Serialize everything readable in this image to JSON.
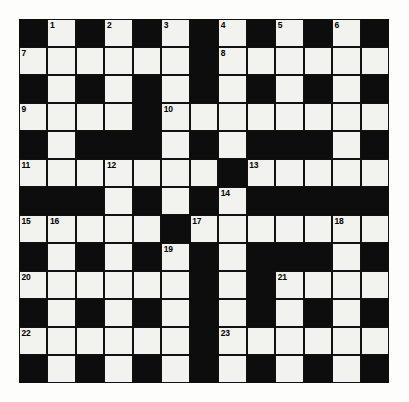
{
  "puzzle": {
    "kind": "crossword-grid",
    "rows": 13,
    "columns": 13,
    "colors": {
      "block": "#0d0d0d",
      "cell": "#f2f2ef",
      "grid_line": "#111111",
      "page_background": "#fdfdfb",
      "number_text": "#000000"
    },
    "numbers_shown": [
      1,
      2,
      3,
      4,
      5,
      6,
      7,
      8,
      9,
      10,
      11,
      12,
      13,
      14,
      15,
      16,
      17,
      18,
      19,
      20,
      21,
      22,
      23
    ],
    "highest_number": 23,
    "blank_cells_filled": 0,
    "cells": [
      [
        {
          "type": "block"
        },
        {
          "type": "light",
          "number": "1"
        },
        {
          "type": "block"
        },
        {
          "type": "light",
          "number": "2"
        },
        {
          "type": "block"
        },
        {
          "type": "light",
          "number": "3"
        },
        {
          "type": "block"
        },
        {
          "type": "light",
          "number": "4"
        },
        {
          "type": "block"
        },
        {
          "type": "light",
          "number": "5"
        },
        {
          "type": "block"
        },
        {
          "type": "light",
          "number": "6"
        },
        {
          "type": "block"
        }
      ],
      [
        {
          "type": "light",
          "number": "7"
        },
        {
          "type": "light"
        },
        {
          "type": "light"
        },
        {
          "type": "light"
        },
        {
          "type": "light"
        },
        {
          "type": "light"
        },
        {
          "type": "block"
        },
        {
          "type": "light",
          "number": "8"
        },
        {
          "type": "light"
        },
        {
          "type": "light"
        },
        {
          "type": "light"
        },
        {
          "type": "light"
        },
        {
          "type": "light"
        }
      ],
      [
        {
          "type": "block"
        },
        {
          "type": "light"
        },
        {
          "type": "block"
        },
        {
          "type": "light"
        },
        {
          "type": "block"
        },
        {
          "type": "light"
        },
        {
          "type": "block"
        },
        {
          "type": "light"
        },
        {
          "type": "block"
        },
        {
          "type": "light"
        },
        {
          "type": "block"
        },
        {
          "type": "light"
        },
        {
          "type": "block"
        }
      ],
      [
        {
          "type": "light",
          "number": "9"
        },
        {
          "type": "light"
        },
        {
          "type": "light"
        },
        {
          "type": "light"
        },
        {
          "type": "block"
        },
        {
          "type": "light",
          "number": "10"
        },
        {
          "type": "light"
        },
        {
          "type": "light"
        },
        {
          "type": "light"
        },
        {
          "type": "light"
        },
        {
          "type": "light"
        },
        {
          "type": "light"
        },
        {
          "type": "light"
        }
      ],
      [
        {
          "type": "block"
        },
        {
          "type": "light"
        },
        {
          "type": "block"
        },
        {
          "type": "block"
        },
        {
          "type": "block"
        },
        {
          "type": "light"
        },
        {
          "type": "block"
        },
        {
          "type": "light"
        },
        {
          "type": "block"
        },
        {
          "type": "block"
        },
        {
          "type": "block"
        },
        {
          "type": "light"
        },
        {
          "type": "block"
        }
      ],
      [
        {
          "type": "light",
          "number": "11"
        },
        {
          "type": "light"
        },
        {
          "type": "light"
        },
        {
          "type": "light",
          "number": "12"
        },
        {
          "type": "light"
        },
        {
          "type": "light"
        },
        {
          "type": "light"
        },
        {
          "type": "block"
        },
        {
          "type": "light",
          "number": "13"
        },
        {
          "type": "light"
        },
        {
          "type": "light"
        },
        {
          "type": "light"
        },
        {
          "type": "light"
        }
      ],
      [
        {
          "type": "block"
        },
        {
          "type": "block"
        },
        {
          "type": "block"
        },
        {
          "type": "light"
        },
        {
          "type": "block"
        },
        {
          "type": "light"
        },
        {
          "type": "block"
        },
        {
          "type": "light",
          "number": "14"
        },
        {
          "type": "block"
        },
        {
          "type": "block"
        },
        {
          "type": "block"
        },
        {
          "type": "block"
        },
        {
          "type": "block"
        }
      ],
      [
        {
          "type": "light",
          "number": "15"
        },
        {
          "type": "light",
          "number": "16"
        },
        {
          "type": "light"
        },
        {
          "type": "light"
        },
        {
          "type": "light"
        },
        {
          "type": "block"
        },
        {
          "type": "light",
          "number": "17"
        },
        {
          "type": "light"
        },
        {
          "type": "light"
        },
        {
          "type": "light"
        },
        {
          "type": "light"
        },
        {
          "type": "light",
          "number": "18"
        },
        {
          "type": "light"
        }
      ],
      [
        {
          "type": "block"
        },
        {
          "type": "light"
        },
        {
          "type": "block"
        },
        {
          "type": "light"
        },
        {
          "type": "block"
        },
        {
          "type": "light",
          "number": "19"
        },
        {
          "type": "block"
        },
        {
          "type": "light"
        },
        {
          "type": "block"
        },
        {
          "type": "block"
        },
        {
          "type": "block"
        },
        {
          "type": "light"
        },
        {
          "type": "block"
        }
      ],
      [
        {
          "type": "light",
          "number": "20"
        },
        {
          "type": "light"
        },
        {
          "type": "light"
        },
        {
          "type": "light"
        },
        {
          "type": "light"
        },
        {
          "type": "light"
        },
        {
          "type": "block"
        },
        {
          "type": "light"
        },
        {
          "type": "block"
        },
        {
          "type": "light",
          "number": "21"
        },
        {
          "type": "light"
        },
        {
          "type": "light"
        },
        {
          "type": "light"
        }
      ],
      [
        {
          "type": "block"
        },
        {
          "type": "light"
        },
        {
          "type": "block"
        },
        {
          "type": "light"
        },
        {
          "type": "block"
        },
        {
          "type": "light"
        },
        {
          "type": "block"
        },
        {
          "type": "light"
        },
        {
          "type": "block"
        },
        {
          "type": "light"
        },
        {
          "type": "block"
        },
        {
          "type": "light"
        },
        {
          "type": "block"
        }
      ],
      [
        {
          "type": "light",
          "number": "22"
        },
        {
          "type": "light"
        },
        {
          "type": "light"
        },
        {
          "type": "light"
        },
        {
          "type": "light"
        },
        {
          "type": "light"
        },
        {
          "type": "block"
        },
        {
          "type": "light",
          "number": "23"
        },
        {
          "type": "light"
        },
        {
          "type": "light"
        },
        {
          "type": "light"
        },
        {
          "type": "light"
        },
        {
          "type": "light"
        }
      ],
      [
        {
          "type": "block"
        },
        {
          "type": "light"
        },
        {
          "type": "block"
        },
        {
          "type": "light"
        },
        {
          "type": "block"
        },
        {
          "type": "light"
        },
        {
          "type": "block"
        },
        {
          "type": "light"
        },
        {
          "type": "block"
        },
        {
          "type": "light"
        },
        {
          "type": "block"
        },
        {
          "type": "light"
        },
        {
          "type": "block"
        }
      ]
    ]
  }
}
